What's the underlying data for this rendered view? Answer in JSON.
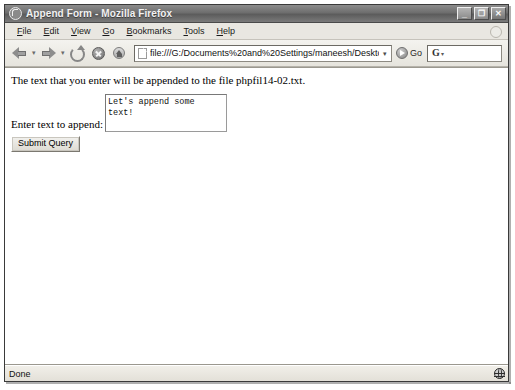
{
  "window": {
    "title": "Append Form - Mozilla Firefox",
    "app_icon": "firefox-icon",
    "controls": {
      "minimize": "_",
      "restore": "❐",
      "close": "✕"
    }
  },
  "menubar": {
    "items": [
      {
        "accel": "F",
        "rest": "ile"
      },
      {
        "accel": "E",
        "rest": "dit"
      },
      {
        "accel": "V",
        "rest": "iew"
      },
      {
        "accel": "G",
        "rest": "o"
      },
      {
        "accel": "B",
        "rest": "ookmarks"
      },
      {
        "accel": "T",
        "rest": "ools"
      },
      {
        "accel": "H",
        "rest": "elp"
      }
    ]
  },
  "toolbar": {
    "back": "back-arrow-icon",
    "forward": "forward-arrow-icon",
    "reload": "reload-icon",
    "stop": "stop-icon",
    "home": "home-icon",
    "caret": "▾",
    "url": "file:///G:/Documents%20and%20Settings/maneesh/Desktop/ARforReal/CH9",
    "url_dropdown": "▾",
    "go_label": "Go",
    "search_value": "G",
    "search_caret": "▾"
  },
  "page": {
    "paragraph": "The text that you enter will be appended to the file phpfil14-02.txt.",
    "form": {
      "label": "Enter text to append:",
      "textarea_value": "Let's append some text!",
      "submit_label": "Submit Query"
    }
  },
  "statusbar": {
    "text": "Done",
    "security_icon": "globe-icon"
  }
}
